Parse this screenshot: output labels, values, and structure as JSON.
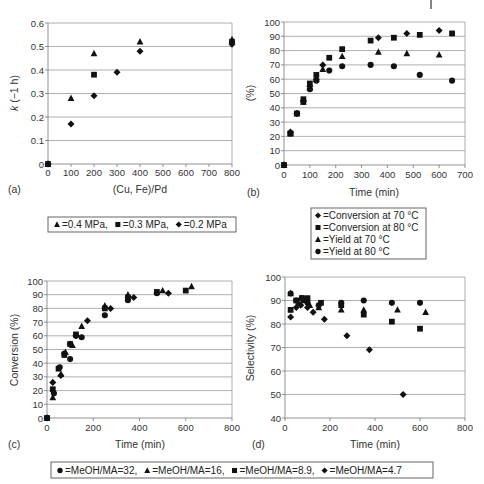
{
  "chart_data": [
    {
      "panel": "(a)",
      "type": "scatter",
      "xlabel": "(Cu, Fe)/Pd",
      "ylabel": "k (−1 h)",
      "xlim": [
        0,
        800
      ],
      "ylim": [
        0,
        0.6
      ],
      "xticks": [
        0,
        100,
        200,
        300,
        400,
        500,
        600,
        700,
        800
      ],
      "yticks": [
        0,
        0.1,
        0.2,
        0.3,
        0.4,
        0.5,
        0.6
      ],
      "ytick_labels": [
        "0",
        "0.1",
        "0.2",
        "0.3",
        "0.4",
        "0.5",
        "0.6"
      ],
      "grid": "horizontal",
      "legend_position": "below",
      "series": [
        {
          "name": "0.4 MPa",
          "marker": "triangle",
          "x": [
            0,
            100,
            200,
            400,
            800
          ],
          "y": [
            0,
            0.28,
            0.47,
            0.52,
            0.53
          ]
        },
        {
          "name": "0.3 MPa",
          "marker": "square",
          "x": [
            0,
            200,
            800
          ],
          "y": [
            0,
            0.38,
            0.52
          ]
        },
        {
          "name": "0.2 MPa",
          "marker": "diamond",
          "x": [
            0,
            100,
            200,
            300,
            400,
            800
          ],
          "y": [
            0,
            0.17,
            0.29,
            0.39,
            0.48,
            0.51
          ]
        }
      ],
      "legend_entries": [
        "=0.4 MPa,",
        "=0.3 MPa,",
        "=0.2 MPa"
      ]
    },
    {
      "panel": "(b)",
      "type": "scatter",
      "xlabel": "Time (min)",
      "ylabel": "(%)",
      "xlim": [
        0,
        700
      ],
      "ylim": [
        0,
        100
      ],
      "xticks": [
        0,
        100,
        200,
        300,
        400,
        500,
        600,
        700
      ],
      "yticks": [
        0,
        10,
        20,
        30,
        40,
        50,
        60,
        70,
        80,
        90,
        100
      ],
      "grid": "horizontal",
      "legend_position": "below",
      "series": [
        {
          "name": "Conversion at 70 °C",
          "marker": "diamond",
          "x": [
            0,
            25,
            50,
            75,
            100,
            125,
            150,
            365,
            475,
            600
          ],
          "y": [
            0,
            23,
            36,
            45,
            55,
            60,
            70,
            89,
            92,
            94
          ]
        },
        {
          "name": "Conversion at 80 °C",
          "marker": "square",
          "x": [
            0,
            25,
            50,
            75,
            100,
            125,
            175,
            225,
            335,
            425,
            525,
            650
          ],
          "y": [
            0,
            22,
            36,
            46,
            57,
            63,
            75,
            81,
            87,
            89,
            91,
            92
          ]
        },
        {
          "name": "Yield at 70 °C",
          "marker": "triangle",
          "x": [
            0,
            25,
            50,
            75,
            100,
            125,
            150,
            225,
            365,
            475,
            600
          ],
          "y": [
            0,
            22,
            36,
            44,
            54,
            60,
            67,
            76,
            79,
            78,
            77
          ]
        },
        {
          "name": "Yield at 80 °C",
          "marker": "circle",
          "x": [
            0,
            25,
            50,
            75,
            100,
            125,
            175,
            225,
            335,
            425,
            525,
            650
          ],
          "y": [
            0,
            22,
            36,
            44,
            53,
            59,
            66,
            69,
            70,
            69,
            63,
            59
          ]
        }
      ],
      "legend_entries": [
        "=Conversion at 70 °C",
        "=Conversion at 80 °C",
        "=Yield at 70 °C",
        "=Yield at 80 °C"
      ]
    },
    {
      "panel": "(c)",
      "type": "scatter",
      "xlabel": "Time (min)",
      "ylabel": "Conversion (%)",
      "xlim": [
        0,
        800
      ],
      "ylim": [
        0,
        100
      ],
      "xticks": [
        0,
        200,
        400,
        600,
        800
      ],
      "yticks": [
        0,
        10,
        20,
        30,
        40,
        50,
        60,
        70,
        80,
        90,
        100
      ],
      "grid": "horizontal",
      "legend_position": "below",
      "series": [
        {
          "name": "MeOH/MA = 32",
          "marker": "circle",
          "x": [
            0,
            30,
            55,
            75,
            100,
            125,
            150,
            250,
            350,
            475
          ],
          "y": [
            0,
            18,
            37,
            47,
            43,
            60,
            59,
            75,
            86,
            91
          ]
        },
        {
          "name": "MeOH/MA = 16",
          "marker": "triangle",
          "x": [
            0,
            25,
            60,
            80,
            110,
            150,
            250,
            350,
            500,
            625
          ],
          "y": [
            0,
            15,
            32,
            48,
            53,
            67,
            82,
            90,
            93,
            96
          ]
        },
        {
          "name": "MeOH/MA = 8.9",
          "marker": "square",
          "x": [
            0,
            25,
            50,
            75,
            100,
            125,
            250,
            350,
            475,
            600
          ],
          "y": [
            0,
            21,
            36,
            46,
            54,
            61,
            80,
            88,
            92,
            93
          ]
        },
        {
          "name": "MeOH/MA = 4.7",
          "marker": "diamond",
          "x": [
            0,
            25,
            60,
            100,
            125,
            175,
            275,
            375,
            525
          ],
          "y": [
            0,
            26,
            31,
            54,
            60,
            71,
            80,
            88,
            91
          ]
        }
      ],
      "legend_entries": [
        "=MeOH/MA=32,",
        "=MeOH/MA=16,",
        "=MeOH/MA=8.9,",
        "=MeOH/MA=4.7"
      ]
    },
    {
      "panel": "(d)",
      "type": "scatter",
      "xlabel": "Time (min)",
      "ylabel": "Selectivity (%)",
      "xlim": [
        0,
        800
      ],
      "ylim": [
        40,
        100
      ],
      "xticks": [
        0,
        200,
        400,
        600,
        800
      ],
      "yticks": [
        40,
        50,
        60,
        70,
        80,
        90,
        100
      ],
      "grid": "horizontal",
      "legend_position": "below",
      "series": [
        {
          "name": "MeOH/MA = 32",
          "marker": "circle",
          "x": [
            25,
            50,
            75,
            100,
            150,
            250,
            350,
            475,
            600
          ],
          "y": [
            93,
            90,
            91,
            89,
            88,
            89,
            90,
            89,
            89
          ]
        },
        {
          "name": "MeOH/MA = 16",
          "marker": "triangle",
          "x": [
            25,
            60,
            80,
            110,
            150,
            250,
            350,
            500,
            625
          ],
          "y": [
            93,
            89,
            90,
            88,
            87,
            86,
            86,
            86,
            85
          ]
        },
        {
          "name": "MeOH/MA = 8.9",
          "marker": "square",
          "x": [
            25,
            50,
            75,
            100,
            160,
            250,
            350,
            475,
            600
          ],
          "y": [
            86,
            90,
            91,
            91,
            89,
            88,
            84,
            81,
            78
          ]
        },
        {
          "name": "MeOH/MA = 4.7",
          "marker": "diamond",
          "x": [
            25,
            50,
            70,
            100,
            125,
            175,
            275,
            375,
            525
          ],
          "y": [
            83,
            87,
            88,
            87,
            85,
            82,
            75,
            69,
            50
          ]
        }
      ],
      "legend_entries": [
        "=MeOH/MA=32,",
        "=MeOH/MA=16,",
        "=MeOH/MA=8.9,",
        "=MeOH/MA=4.7"
      ]
    }
  ],
  "labels": {
    "a": "(a)",
    "b": "(b)",
    "c": "(c)",
    "d": "(d)"
  }
}
